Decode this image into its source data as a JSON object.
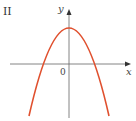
{
  "figure": {
    "panel_label": "II",
    "x_axis_label": "x",
    "y_axis_label": "y",
    "origin_label": "0",
    "curve": {
      "type": "parabola",
      "orientation": "opens-downward",
      "description": "downward parabola with vertex on positive y-axis, two x-intercepts symmetric about the y-axis",
      "color": "#e0502e"
    },
    "axis_color": "#666666"
  }
}
